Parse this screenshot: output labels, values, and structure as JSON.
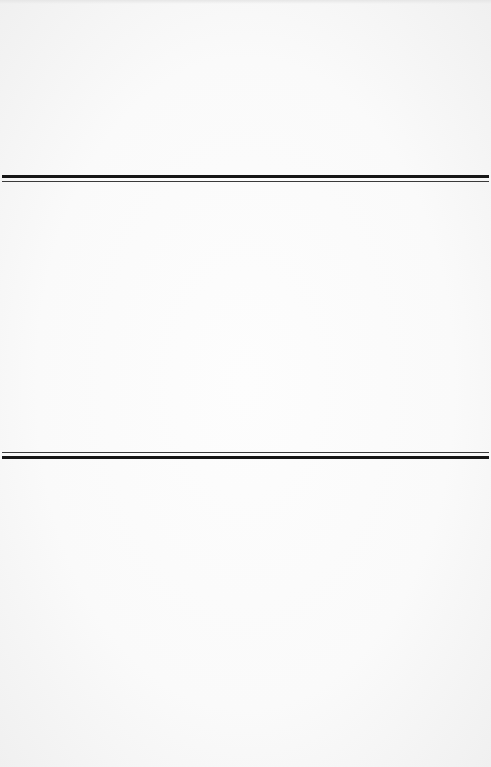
{
  "document": {
    "type": "blank-page",
    "separators": [
      {
        "name": "top-double-rule",
        "order": "thick-then-thin",
        "thick_y": 175,
        "thin_y": 181
      },
      {
        "name": "bottom-double-rule",
        "order": "thin-then-thick",
        "thin_y": 452,
        "thick_y": 456
      }
    ],
    "colors": {
      "paper": "#fafafa",
      "rule": "#161616"
    }
  }
}
